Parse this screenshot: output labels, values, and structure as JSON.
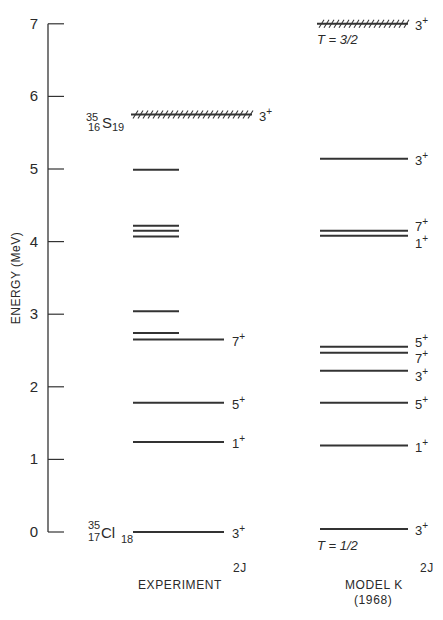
{
  "axis": {
    "title": "ENERGY (MeV)",
    "ticks": [
      0,
      1,
      2,
      3,
      4,
      5,
      6,
      7
    ],
    "ylim": [
      0,
      7
    ]
  },
  "nuclei": {
    "top": {
      "mass": "35",
      "charge": "16",
      "symbol": "S",
      "neutrons": "19"
    },
    "bottom": {
      "mass": "35",
      "charge": "17",
      "symbol": "Cl",
      "neutrons": "18"
    }
  },
  "columns": {
    "experiment": {
      "label": "EXPERIMENT",
      "spin_header": "2J"
    },
    "model": {
      "label": "MODEL K",
      "sublabel": "(1968)",
      "spin_header": "2J"
    }
  },
  "isospin_labels": {
    "upper": "T = 3/2",
    "lower": "T = 1/2"
  },
  "chart_data": {
    "type": "level_scheme",
    "title": "",
    "ylabel": "ENERGY (MeV)",
    "ylim": [
      0,
      7
    ],
    "series": [
      {
        "name": "EXPERIMENT",
        "levels": [
          {
            "energy": 0.0,
            "spin": "3+",
            "long": true
          },
          {
            "energy": 1.24,
            "spin": "1+",
            "long": true
          },
          {
            "energy": 1.78,
            "spin": "5+",
            "long": true
          },
          {
            "energy": 2.65,
            "spin": "7+",
            "long": true
          },
          {
            "energy": 2.74,
            "spin": "",
            "long": false
          },
          {
            "energy": 3.04,
            "spin": "",
            "long": false
          },
          {
            "energy": 4.07,
            "spin": "",
            "long": false
          },
          {
            "energy": 4.15,
            "spin": "",
            "long": false
          },
          {
            "energy": 4.22,
            "spin": "",
            "long": false
          },
          {
            "energy": 4.99,
            "spin": "",
            "long": false
          },
          {
            "energy": 5.75,
            "spin": "3+",
            "long": true,
            "hatched": true,
            "isospin": "3/2"
          }
        ]
      },
      {
        "name": "MODEL K (1968)",
        "levels": [
          {
            "energy": 0.04,
            "spin": "3+",
            "isospin": "1/2"
          },
          {
            "energy": 1.19,
            "spin": "1+"
          },
          {
            "energy": 1.78,
            "spin": "5+"
          },
          {
            "energy": 2.22,
            "spin": "3+"
          },
          {
            "energy": 2.47,
            "spin": "7+"
          },
          {
            "energy": 2.55,
            "spin": "5+"
          },
          {
            "energy": 4.08,
            "spin": "1+"
          },
          {
            "energy": 4.15,
            "spin": "7+"
          },
          {
            "energy": 5.14,
            "spin": "3+"
          },
          {
            "energy": 7.0,
            "spin": "3+",
            "hatched": true,
            "isospin": "3/2"
          }
        ]
      }
    ]
  }
}
